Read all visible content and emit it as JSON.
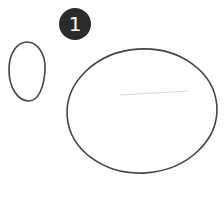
{
  "step": {
    "number": "1",
    "badge_color": "#2b2b2b"
  },
  "shapes": [
    {
      "name": "small-egg-oval",
      "stroke": "#444444"
    },
    {
      "name": "large-oval",
      "stroke": "#444444"
    },
    {
      "name": "guide-line",
      "stroke": "#d8d8d8"
    }
  ]
}
